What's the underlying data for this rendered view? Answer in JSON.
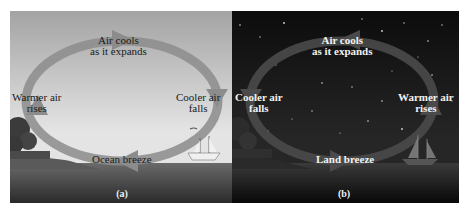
{
  "figure": {
    "panels": [
      {
        "id": "a",
        "caption": "(a)",
        "scene": "day",
        "labels": {
          "top": [
            "Air cools",
            "as it expands"
          ],
          "left": [
            "Warmer air",
            "rises"
          ],
          "right": [
            "Cooler air",
            "falls"
          ],
          "bottom": "Ocean breeze"
        },
        "circulation": "clockwise",
        "colors": {
          "sky_top": "#9c9c9c",
          "sky_bottom": "#e6e6e6",
          "water": "#3a3a3a",
          "arrow": "#8a8a8a"
        }
      },
      {
        "id": "b",
        "caption": "(b)",
        "scene": "night",
        "labels": {
          "top": [
            "Air cools",
            "as it expands"
          ],
          "left": [
            "Cooler air",
            "falls"
          ],
          "right": [
            "Warmer air",
            "rises"
          ],
          "bottom": "Land breeze"
        },
        "circulation": "counterclockwise",
        "colors": {
          "sky_top": "#0d0d0d",
          "sky_bottom": "#252525",
          "water": "#101010",
          "arrow": "#4a4a4a"
        }
      }
    ]
  }
}
